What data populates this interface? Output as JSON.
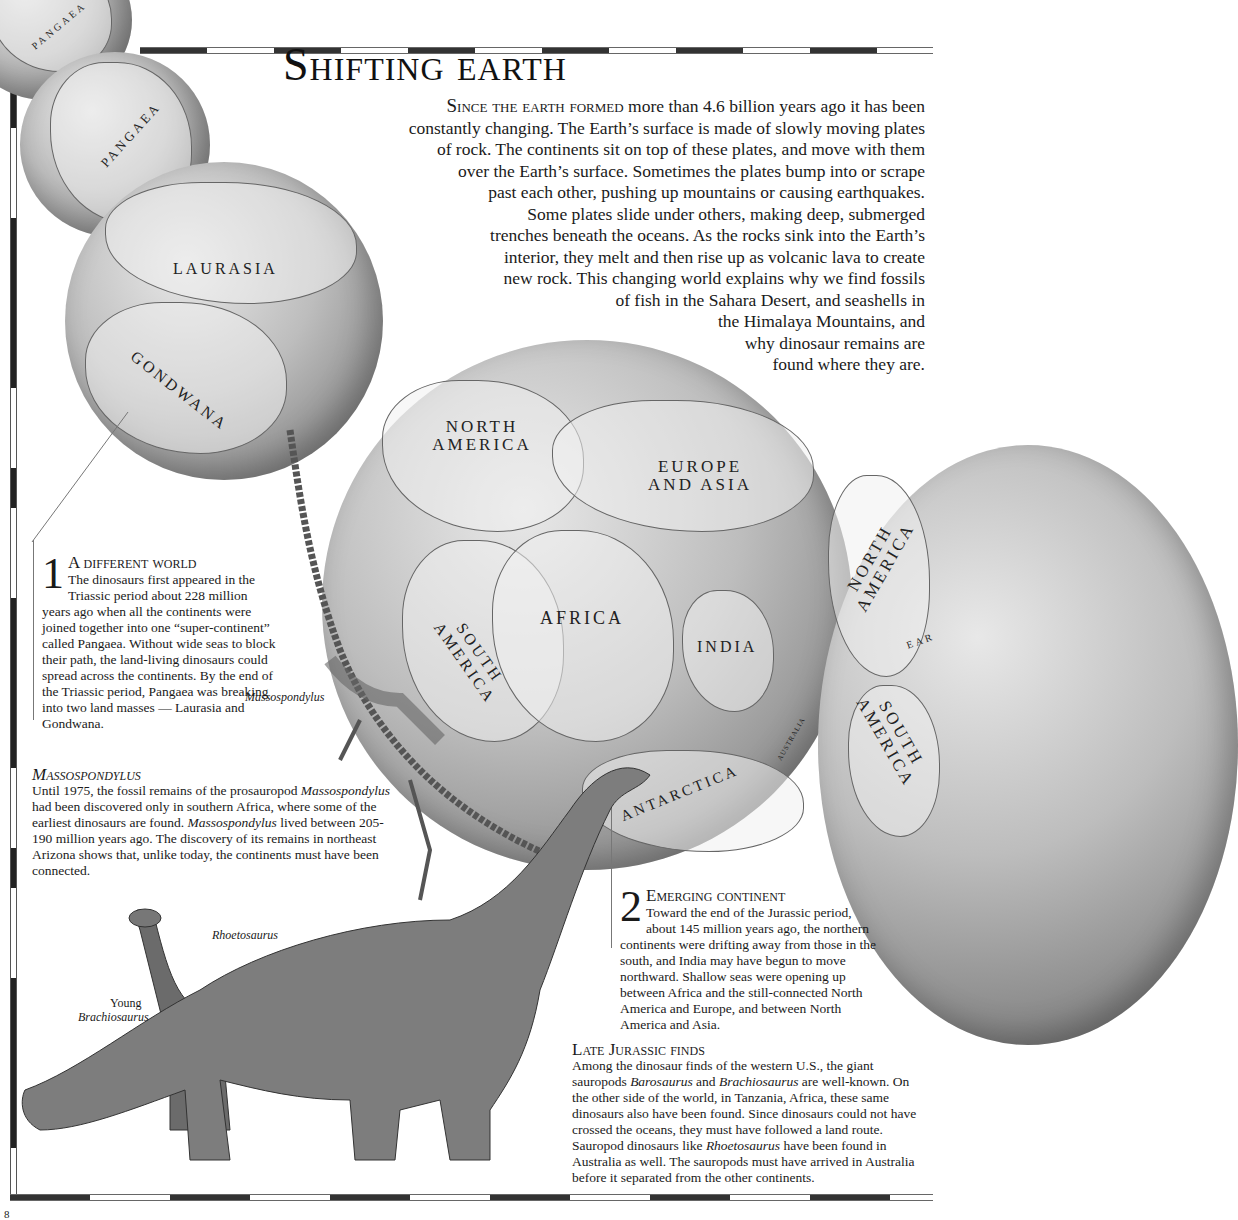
{
  "page": {
    "title": "Shifting earth",
    "page_number": "8",
    "intro": {
      "lead": "Since the earth formed",
      "lines": [
        "more than 4.6 billion years ago it has been",
        "constantly changing. The Earth’s surface is made of slowly moving plates",
        "of rock. The continents sit on top of these plates, and move with them",
        "over the Earth’s surface. Sometimes the plates bump into or scrape",
        "past each other, pushing up mountains or causing earthquakes.",
        "Some plates slide under others, making deep, submerged",
        "trenches beneath the oceans. As the rocks sink into the Earth’s",
        "interior, they melt and then rise up as volcanic lava to create",
        "new rock. This changing world explains why we find fossils",
        "of fish in the Sahara Desert, and seashells in",
        "the Himalaya Mountains, and",
        "why dinosaur remains are",
        "found where they are."
      ]
    }
  },
  "globes": {
    "globe1": {
      "labels": [
        "PANGAEA"
      ]
    },
    "globe2": {
      "labels": [
        "PANGAEA"
      ]
    },
    "globe3": {
      "labels": [
        "LAURASIA",
        "GONDWANA"
      ]
    },
    "globe4": {
      "labels": [
        "NORTH AMERICA",
        "EUROPE AND ASIA",
        "SOUTH AMERICA",
        "AFRICA",
        "INDIA",
        "ANTARCTICA",
        "AUSTRALIA"
      ]
    },
    "globe5": {
      "labels": [
        "NORTH AMERICA",
        "EAR",
        "SOUTH AMERICA"
      ]
    }
  },
  "callout1": {
    "number": "1",
    "heading": "A different world",
    "text": "The dinosaurs first appeared in the Triassic period about 228 million years ago when all the continents were joined together into one “super-continent” called Pangaea. Without wide seas to block their path, the land-living dinosaurs could spread across the continents. By the end of the Triassic period, Pangaea was breaking into two land masses — Laurasia and Gondwana."
  },
  "massospondylus": {
    "title": "Massospondylus",
    "caption": "Massospondylus",
    "text_parts": [
      "Until 1975, the fossil remains of the prosauropod ",
      "Massospondylus",
      " had been discovered only in southern Africa, where some of the earliest dinosaurs are found. ",
      "Massospondylus",
      " lived between 205-190 million years ago. The discovery of its remains in northeast Arizona shows that, unlike today, the continents must have been connected."
    ]
  },
  "callout2": {
    "number": "2",
    "heading": "Emerging continent",
    "text": "Toward the end of the Jurassic period, about 145 million years ago, the northern continents were drifting away from those in the south, and India may have begun to move northward. Shallow seas were opening up between Africa and the still-connected North America and Europe, and between North America and Asia."
  },
  "late_jurassic": {
    "title": "Late Jurassic finds",
    "text_parts": [
      "Among the dinosaur finds of the western U.S., the giant sauropods ",
      "Barosaurus",
      " and ",
      "Brachiosaurus",
      " are well-known. On the other side of the world, in Tanzania, Africa, these same dinosaurs also have been found. Since dinosaurs could not have crossed the oceans, they must have followed a land route. Sauropod dinosaurs like ",
      "Rhoetosaurus",
      " have been found in Australia as well. The sauropods must have arrived in Australia before it separated from the other continents."
    ]
  },
  "illustration_captions": {
    "rhoetosaurus": "Rhoetosaurus",
    "young": "Young",
    "brachiosaurus": "Brachiosaurus"
  }
}
